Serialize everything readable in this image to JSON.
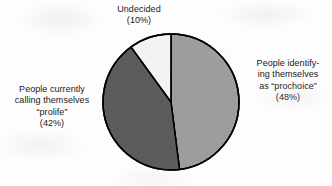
{
  "figure": {
    "name": "abortion-opinion-pie-chart",
    "background_color": "#fdfdfd",
    "outline_color": "#1f1f1f"
  },
  "labels": {
    "undecided": {
      "lines": [
        "Undecided",
        "(10%)"
      ],
      "line1": "Undecided",
      "line2": "(10%)"
    },
    "prochoice": {
      "lines": [
        "People identify-",
        "ing themselves",
        "as “prochoice”",
        "(48%)"
      ],
      "line1": "People identify-",
      "line2": "ing themselves",
      "line3": "as “prochoice”",
      "line4": "(48%)"
    },
    "prolife": {
      "lines": [
        "People currently",
        "calling themselves",
        "“prolife”",
        "(42%)"
      ],
      "line1": "People currently",
      "line2": "calling themselves",
      "line3": "“prolife”",
      "line4": "(42%)"
    }
  },
  "chart_data": {
    "type": "pie",
    "title": "",
    "subtitle": "",
    "xlabel": "",
    "ylabel": "",
    "grid": false,
    "legend": "none",
    "labels_position": "outside-callouts",
    "start_angle_deg": 0,
    "direction": "clockwise",
    "center_px": [
      171,
      102
    ],
    "radius_px": 68,
    "categories": [
      "People identifying themselves as “prochoice”",
      "People currently calling themselves “prolife”",
      "Undecided"
    ],
    "values": [
      48,
      42,
      10
    ],
    "value_unit": "percent",
    "value_labels": [
      "(48%)",
      "(42%)",
      "(10%)"
    ],
    "slices": [
      {
        "key": "prochoice",
        "label": "People identifying themselves as “prochoice”",
        "value": 48,
        "value_label": "(48%)",
        "fill": "#c9c9c9",
        "stroke": "#1f1f1f",
        "start_angle_deg": 0,
        "end_angle_deg": 172.8
      },
      {
        "key": "prolife",
        "label": "People currently calling themselves “prolife”",
        "value": 42,
        "value_label": "(42%)",
        "fill": "#999999",
        "stroke": "#1f1f1f",
        "start_angle_deg": 172.8,
        "end_angle_deg": 324.0
      },
      {
        "key": "undecided",
        "label": "Undecided",
        "value": 10,
        "value_label": "(10%)",
        "fill": "#fbfbfb",
        "stroke": "#1f1f1f",
        "start_angle_deg": 324.0,
        "end_angle_deg": 360.0
      }
    ],
    "total": 100
  }
}
